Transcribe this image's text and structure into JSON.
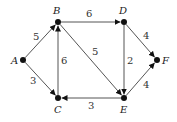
{
  "diagram": {
    "type": "directed-weighted-graph",
    "nodes": [
      {
        "id": "A",
        "label": "A",
        "x": 23,
        "y": 60,
        "lx": 11,
        "ly": 64
      },
      {
        "id": "B",
        "label": "B",
        "x": 58,
        "y": 22,
        "lx": 53,
        "ly": 14
      },
      {
        "id": "C",
        "label": "C",
        "x": 58,
        "y": 98,
        "lx": 54,
        "ly": 113
      },
      {
        "id": "D",
        "label": "D",
        "x": 124,
        "y": 22,
        "lx": 119,
        "ly": 14
      },
      {
        "id": "E",
        "label": "E",
        "x": 124,
        "y": 98,
        "lx": 120,
        "ly": 113
      },
      {
        "id": "F",
        "label": "F",
        "x": 157,
        "y": 60,
        "lx": 162,
        "ly": 64
      }
    ],
    "edges": [
      {
        "from": "A",
        "to": "B",
        "weight": "5",
        "wx": 33,
        "wy": 40
      },
      {
        "from": "A",
        "to": "C",
        "weight": "3",
        "wx": 30,
        "wy": 84
      },
      {
        "from": "C",
        "to": "B",
        "weight": "6",
        "wx": 61,
        "wy": 64
      },
      {
        "from": "B",
        "to": "D",
        "weight": "6",
        "wx": 86,
        "wy": 17
      },
      {
        "from": "B",
        "to": "E",
        "weight": "5",
        "wx": 92,
        "wy": 55
      },
      {
        "from": "D",
        "to": "E",
        "weight": "2",
        "wx": 127,
        "wy": 64
      },
      {
        "from": "D",
        "to": "F",
        "weight": "4",
        "wx": 143,
        "wy": 39
      },
      {
        "from": "E",
        "to": "F",
        "weight": "4",
        "wx": 143,
        "wy": 88
      },
      {
        "from": "E",
        "to": "C",
        "weight": "3",
        "wx": 88,
        "wy": 109
      }
    ]
  }
}
